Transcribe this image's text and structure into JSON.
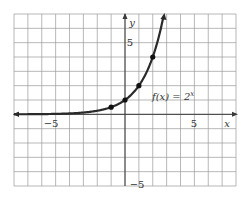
{
  "chart_data": {
    "type": "line",
    "title": "",
    "function_label": "f(x) = 2^x",
    "function_label_parts": {
      "f": "f(x) = 2",
      "exp": "x"
    },
    "xlabel": "x",
    "ylabel": "y",
    "xlim": [
      -8,
      8
    ],
    "ylim": [
      -5,
      7
    ],
    "grid": true,
    "tick_labels": {
      "x_neg": "−5",
      "x_pos": "5",
      "y_pos": "5",
      "y_neg": "−5"
    },
    "series": [
      {
        "name": "f(x) = 2^x",
        "x": [
          -8,
          -6,
          -4,
          -3,
          -2,
          -1,
          0,
          1,
          2,
          2.5,
          2.8
        ],
        "y": [
          0.0039,
          0.0156,
          0.0625,
          0.125,
          0.25,
          0.5,
          1,
          2,
          4,
          5.66,
          6.96
        ]
      }
    ],
    "marked_points": [
      {
        "x": -1,
        "y": 0.5
      },
      {
        "x": 0,
        "y": 1
      },
      {
        "x": 1,
        "y": 2
      },
      {
        "x": 2,
        "y": 4
      }
    ],
    "colors": {
      "curve": "#2a2a2a",
      "grid": "#9a9a9a",
      "axis": "#3a3a3a"
    }
  }
}
